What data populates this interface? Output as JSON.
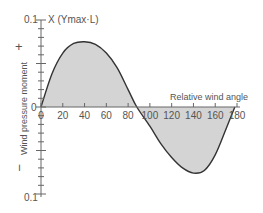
{
  "chart_data": {
    "type": "area",
    "title": "",
    "xlabel": "Relative wind angle",
    "ylabel": "Wind pressure moment",
    "y_unit_label": "X (Ymax·L)",
    "y_sign_labels": {
      "positive": "+",
      "negative": "−"
    },
    "y_tick_labels": {
      "top": "0.1",
      "zero": "0",
      "bottom": "0.1"
    },
    "x_ticks": [
      0,
      20,
      40,
      60,
      80,
      100,
      120,
      140,
      160,
      180
    ],
    "xlim": [
      0,
      180
    ],
    "ylim": [
      -0.1,
      0.1
    ],
    "grid": false,
    "series": [
      {
        "name": "Wind pressure moment",
        "x": [
          0,
          10,
          20,
          30,
          40,
          50,
          60,
          70,
          80,
          88,
          100,
          110,
          120,
          130,
          140,
          150,
          160,
          170,
          178
        ],
        "values": [
          0,
          0.038,
          0.062,
          0.073,
          0.075,
          0.072,
          0.062,
          0.045,
          0.02,
          0,
          -0.022,
          -0.042,
          -0.058,
          -0.07,
          -0.076,
          -0.073,
          -0.055,
          -0.025,
          0
        ]
      }
    ],
    "fill_color": "#d4d4d4",
    "line_color": "#333333"
  }
}
